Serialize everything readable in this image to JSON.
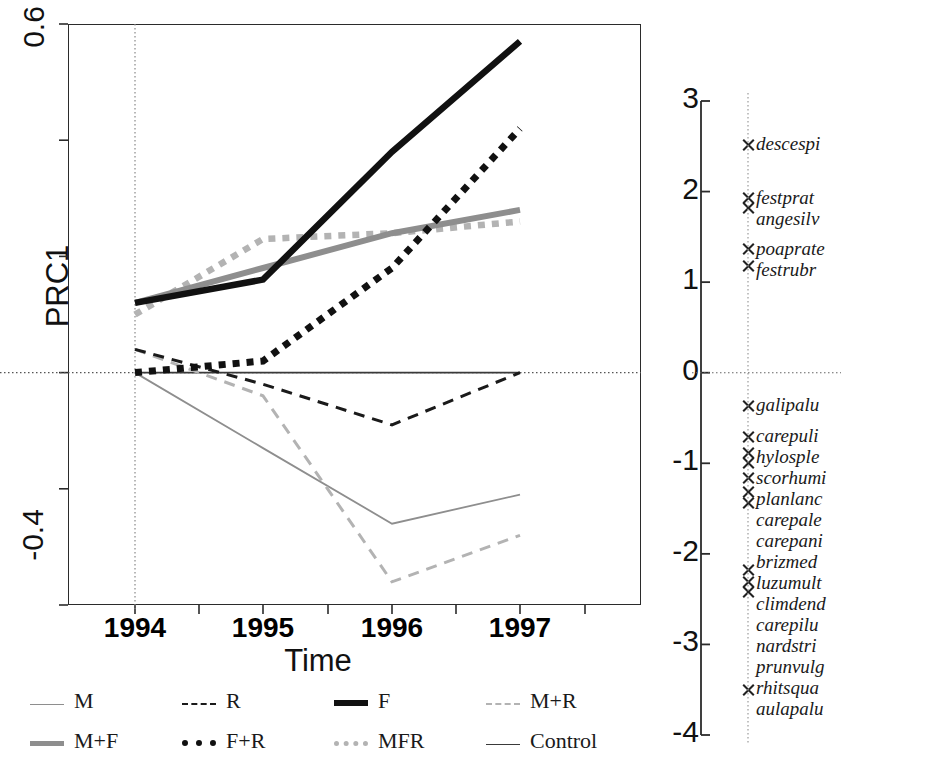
{
  "chart_data": {
    "type": "line",
    "title": "",
    "xlabel": "Time",
    "ylabel": "PRC1",
    "x": [
      1994,
      1995,
      1996,
      1997
    ],
    "xtick_labels": [
      "1994",
      "1995",
      "1996",
      "1997"
    ],
    "ylim": [
      -0.4,
      0.6
    ],
    "ytick_labels": [
      "0.6",
      "-0.4"
    ],
    "yticks": [
      0.6,
      0.4,
      0.2,
      0.0,
      -0.2,
      -0.4
    ],
    "grid": false,
    "zero_line": true,
    "legend_position": "bottom",
    "series": [
      {
        "name": "M",
        "style": "thin-solid-gray",
        "color": "#8e8e8e",
        "values": [
          0.0,
          -0.13,
          -0.26,
          -0.21
        ]
      },
      {
        "name": "R",
        "style": "dashed-black",
        "color": "#1a1a1a",
        "values": [
          0.04,
          -0.02,
          -0.09,
          0.0
        ]
      },
      {
        "name": "F",
        "style": "thick-solid-black",
        "color": "#111111",
        "values": [
          0.12,
          0.16,
          0.38,
          0.57
        ]
      },
      {
        "name": "M+R",
        "style": "dashed-lightgray",
        "color": "#b3b3b3",
        "values": [
          0.04,
          -0.04,
          -0.36,
          -0.28
        ]
      },
      {
        "name": "M+F",
        "style": "thick-solid-gray",
        "color": "#8e8e8e",
        "values": [
          0.12,
          0.18,
          0.24,
          0.28
        ]
      },
      {
        "name": "F+R",
        "style": "dotted-black",
        "color": "#111111",
        "values": [
          0.0,
          0.02,
          0.18,
          0.42
        ]
      },
      {
        "name": "MFR",
        "style": "dotted-lightgray",
        "color": "#b3b3b3",
        "values": [
          0.1,
          0.23,
          0.24,
          0.26
        ]
      },
      {
        "name": "Control",
        "style": "thin-solid-black",
        "color": "#3a3a3a",
        "values": [
          0.0,
          0.0,
          0.0,
          0.0
        ]
      }
    ]
  },
  "species_panel": {
    "axis_label": "",
    "ylim": [
      -4,
      3
    ],
    "tick_labels": [
      "3",
      "2",
      "1",
      "0",
      "-1",
      "-2",
      "-3",
      "-4"
    ],
    "ticks": [
      3,
      2,
      1,
      0,
      -1,
      -2,
      -3,
      -4
    ],
    "zero_line": true,
    "species": [
      {
        "name": "descespi",
        "weight": 2.52,
        "marker": true
      },
      {
        "name": "festprat",
        "weight": 1.93,
        "marker": true
      },
      {
        "name": "angesilv",
        "weight": 1.82,
        "marker": true
      },
      {
        "name": "poaprate",
        "weight": 1.37,
        "marker": true
      },
      {
        "name": "festrubr",
        "weight": 1.18,
        "marker": true
      },
      {
        "name": "galipalu",
        "weight": -0.36,
        "marker": true
      },
      {
        "name": "carepuli",
        "weight": -0.7,
        "marker": true
      },
      {
        "name": "hylosple",
        "weight": -0.88,
        "marker": true
      },
      {
        "name": "scorhumi",
        "weight": -0.88,
        "marker": false
      },
      {
        "name": "planlanc",
        "weight": -0.99,
        "marker": true
      },
      {
        "name": "carepale",
        "weight": -1.16,
        "marker": true
      },
      {
        "name": "carepani",
        "weight": -1.31,
        "marker": true
      },
      {
        "name": "brizmed",
        "weight": -1.43,
        "marker": true
      },
      {
        "name": "luzumult",
        "weight": -1.55,
        "marker": false
      },
      {
        "name": "climdend",
        "weight": -2.17,
        "marker": true
      },
      {
        "name": "carepilu",
        "weight": -2.3,
        "marker": true
      },
      {
        "name": "nardstri",
        "weight": -2.42,
        "marker": true
      },
      {
        "name": "prunvulg",
        "weight": -2.42,
        "marker": false
      },
      {
        "name": "rhitsqua",
        "weight": -2.55,
        "marker": false
      },
      {
        "name": "aulapalu",
        "weight": -3.5,
        "marker": true
      }
    ]
  },
  "legend": {
    "rows": [
      [
        {
          "label": "M",
          "swatch": "sw-thin-gray"
        },
        {
          "label": "R",
          "swatch": "sw-dash-black"
        },
        {
          "label": "F",
          "swatch": "sw-thick-black"
        },
        {
          "label": "M+R",
          "swatch": "sw-dash-lgray"
        }
      ],
      [
        {
          "label": "M+F",
          "swatch": "sw-thick-gray"
        },
        {
          "label": "F+R",
          "swatch": "sw-dot-black"
        },
        {
          "label": "MFR",
          "swatch": "sw-dot-gray"
        },
        {
          "label": "Control",
          "swatch": "sw-thin-black"
        }
      ]
    ]
  }
}
